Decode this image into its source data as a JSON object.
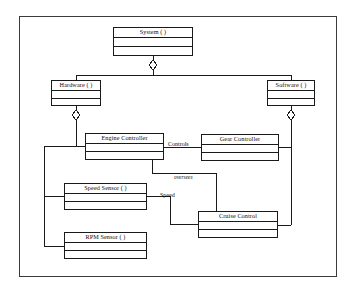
{
  "diagram": {
    "type": "uml-class-aggregation-diagram",
    "title": "",
    "frame": {
      "x": 19,
      "y": 16,
      "width": 318,
      "height": 261
    },
    "classes": [
      {
        "id": "system",
        "name": "System ( )",
        "x": 113,
        "y": 27,
        "width": 80,
        "height": 29,
        "compartments": 3
      },
      {
        "id": "hardware",
        "name": "Hardware ( )",
        "x": 51,
        "y": 80,
        "width": 50,
        "height": 26,
        "compartments": 3
      },
      {
        "id": "software",
        "name": "Software ( )",
        "x": 267,
        "y": 80,
        "width": 48,
        "height": 26,
        "compartments": 3
      },
      {
        "id": "engine-controller",
        "name": "Engine Controller",
        "x": 85,
        "y": 133,
        "width": 79,
        "height": 27,
        "compartments": 3
      },
      {
        "id": "gear-controller",
        "name": "Gear Controller",
        "x": 201,
        "y": 134,
        "width": 78,
        "height": 27,
        "compartments": 3
      },
      {
        "id": "speed-sensor",
        "name": "Speed Sensor ( )",
        "x": 64,
        "y": 183,
        "width": 83,
        "height": 27,
        "compartments": 3
      },
      {
        "id": "cruise-control",
        "name": "Cruise Control",
        "x": 198,
        "y": 211,
        "width": 80,
        "height": 27,
        "compartments": 3
      },
      {
        "id": "rpm-sensor",
        "name": "RPM Sensor ( )",
        "x": 64,
        "y": 232,
        "width": 83,
        "height": 27,
        "compartments": 3
      }
    ],
    "edge_labels": [
      {
        "id": "controls",
        "text": "Controls",
        "x": 168,
        "y": 141,
        "italic": false
      },
      {
        "id": "oversees",
        "text": "oversees",
        "x": 174,
        "y": 178,
        "italic": true
      },
      {
        "id": "speed",
        "text": "Speed",
        "x": 160,
        "y": 194,
        "italic": false
      }
    ],
    "relationships": [
      {
        "from": "system",
        "to": "hardware",
        "kind": "aggregation"
      },
      {
        "from": "system",
        "to": "software",
        "kind": "aggregation"
      },
      {
        "from": "hardware",
        "to": "engine-controller",
        "kind": "aggregation"
      },
      {
        "from": "hardware",
        "to": "speed-sensor",
        "kind": "aggregation"
      },
      {
        "from": "hardware",
        "to": "rpm-sensor",
        "kind": "aggregation"
      },
      {
        "from": "software",
        "to": "gear-controller",
        "kind": "aggregation"
      },
      {
        "from": "software",
        "to": "cruise-control",
        "kind": "aggregation"
      },
      {
        "from": "engine-controller",
        "to": "gear-controller",
        "kind": "association",
        "label": "Controls"
      },
      {
        "from": "engine-controller",
        "to": "cruise-control",
        "kind": "association",
        "label": "oversees"
      },
      {
        "from": "speed-sensor",
        "to": "cruise-control",
        "kind": "association",
        "label": "Speed"
      }
    ],
    "colors": {
      "stroke": "#1a1a1a",
      "frame_stroke": "#3a3a3a",
      "fill": "#ffffff",
      "text": "#0d0d0d"
    }
  }
}
